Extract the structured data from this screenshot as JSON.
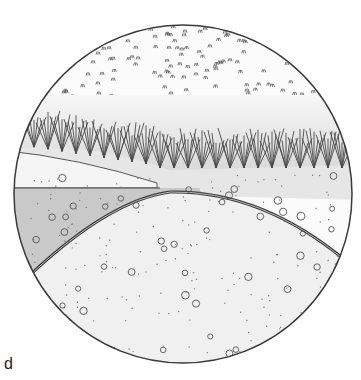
{
  "figure": {
    "panel_label": "d",
    "colors": {
      "outline": "#3a3a3a",
      "water": "#c9c9c9",
      "wedge": "#f4f4f4",
      "soil": "#e4e4e4",
      "sediment": "#f1f1f1",
      "grass": "#4a4a4a",
      "sky_speckle": "#555555"
    },
    "regions": [
      {
        "name": "sparse-vegetation-area"
      },
      {
        "name": "dense-grass-band"
      },
      {
        "name": "soil-bank"
      },
      {
        "name": "light-wedge"
      },
      {
        "name": "water-body"
      },
      {
        "name": "arched-layer-line"
      },
      {
        "name": "pebble-sediment-dome"
      }
    ]
  }
}
